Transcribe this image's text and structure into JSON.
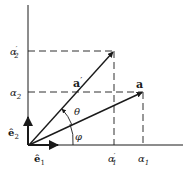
{
  "diagram": {
    "colors": {
      "ink": "#1a1a1a",
      "background": "#ffffff"
    },
    "axes": {
      "origin": [
        28,
        145
      ],
      "y_axis_top": 5,
      "x_axis_right": 183
    },
    "basis": {
      "e1": {
        "label": "ê",
        "subscript": "1",
        "tip": [
          58,
          145
        ]
      },
      "e2": {
        "label": "ê",
        "subscript": "2",
        "tip": [
          28,
          117
        ]
      }
    },
    "vectors": [
      {
        "name": "a_prime",
        "label": "a",
        "prime": "′",
        "tip": [
          114,
          51
        ]
      },
      {
        "name": "a",
        "label": "a",
        "prime": "",
        "tip": [
          143,
          92
        ]
      }
    ],
    "angles": [
      {
        "name": "theta",
        "label": "θ"
      },
      {
        "name": "phi",
        "label": "φ"
      }
    ],
    "tick_labels": {
      "y": [
        {
          "name": "alpha2_prime",
          "base": "α",
          "subscript": "2",
          "prime": "′",
          "y": 51
        },
        {
          "name": "alpha2",
          "base": "α",
          "subscript": "2",
          "prime": "",
          "y": 92
        }
      ],
      "x": [
        {
          "name": "alpha1_prime",
          "base": "α",
          "subscript": "1",
          "prime": "′",
          "x": 114
        },
        {
          "name": "alpha1",
          "base": "α",
          "subscript": "1",
          "prime": "",
          "x": 143
        }
      ]
    }
  }
}
